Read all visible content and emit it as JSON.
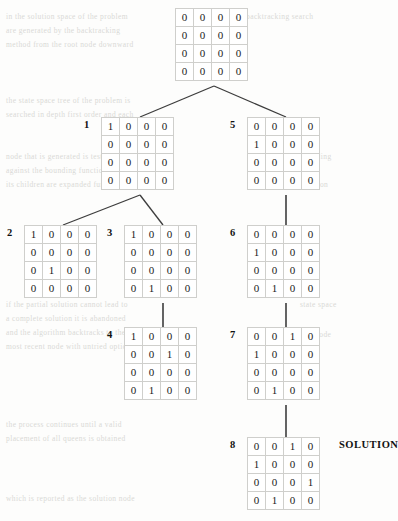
{
  "diagram": {
    "solution_label": "SOLUTION",
    "line_color": "#3d3d3d",
    "grid_border_color": "#b9b9b6",
    "cell_border_color": "#cfcfcc",
    "text_color": "#1a1a1a"
  },
  "nodes": [
    {
      "id": "root",
      "label": "",
      "x": 175,
      "y": 8,
      "rows": [
        [
          "0",
          "0",
          "0",
          "0"
        ],
        [
          "0",
          "0",
          "0",
          "0"
        ],
        [
          "0",
          "0",
          "0",
          "0"
        ],
        [
          "0",
          "0",
          "0",
          "0"
        ]
      ]
    },
    {
      "id": "n1",
      "label": "1",
      "x": 101,
      "y": 117,
      "rows": [
        [
          "1",
          "0",
          "0",
          "0"
        ],
        [
          "0",
          "0",
          "0",
          "0"
        ],
        [
          "0",
          "0",
          "0",
          "0"
        ],
        [
          "0",
          "0",
          "0",
          "0"
        ]
      ]
    },
    {
      "id": "n5",
      "label": "5",
      "x": 247,
      "y": 117,
      "rows": [
        [
          "0",
          "0",
          "0",
          "0"
        ],
        [
          "1",
          "0",
          "0",
          "0"
        ],
        [
          "0",
          "0",
          "0",
          "0"
        ],
        [
          "0",
          "0",
          "0",
          "0"
        ]
      ]
    },
    {
      "id": "n2",
      "label": "2",
      "x": 24,
      "y": 225,
      "rows": [
        [
          "1",
          "0",
          "0",
          "0"
        ],
        [
          "0",
          "0",
          "0",
          "0"
        ],
        [
          "0",
          "1",
          "0",
          "0"
        ],
        [
          "0",
          "0",
          "0",
          "0"
        ]
      ]
    },
    {
      "id": "n3",
      "label": "3",
      "x": 124,
      "y": 225,
      "rows": [
        [
          "1",
          "0",
          "0",
          "0"
        ],
        [
          "0",
          "0",
          "0",
          "0"
        ],
        [
          "0",
          "0",
          "0",
          "0"
        ],
        [
          "0",
          "1",
          "0",
          "0"
        ]
      ]
    },
    {
      "id": "n6",
      "label": "6",
      "x": 247,
      "y": 225,
      "rows": [
        [
          "0",
          "0",
          "0",
          "0"
        ],
        [
          "1",
          "0",
          "0",
          "0"
        ],
        [
          "0",
          "0",
          "0",
          "0"
        ],
        [
          "0",
          "1",
          "0",
          "0"
        ]
      ]
    },
    {
      "id": "n4",
      "label": "4",
      "x": 124,
      "y": 327,
      "rows": [
        [
          "1",
          "0",
          "0",
          "0"
        ],
        [
          "0",
          "0",
          "1",
          "0"
        ],
        [
          "0",
          "0",
          "0",
          "0"
        ],
        [
          "0",
          "1",
          "0",
          "0"
        ]
      ]
    },
    {
      "id": "n7",
      "label": "7",
      "x": 247,
      "y": 327,
      "rows": [
        [
          "0",
          "0",
          "1",
          "0"
        ],
        [
          "1",
          "0",
          "0",
          "0"
        ],
        [
          "0",
          "0",
          "0",
          "0"
        ],
        [
          "0",
          "1",
          "0",
          "0"
        ]
      ]
    },
    {
      "id": "n8",
      "label": "8",
      "x": 247,
      "y": 437,
      "rows": [
        [
          "0",
          "0",
          "1",
          "0"
        ],
        [
          "1",
          "0",
          "0",
          "0"
        ],
        [
          "0",
          "0",
          "0",
          "1"
        ],
        [
          "0",
          "1",
          "0",
          "0"
        ]
      ]
    }
  ],
  "edges": [
    {
      "from": "root",
      "to": "n1",
      "type": "diagonal"
    },
    {
      "from": "root",
      "to": "n5",
      "type": "diagonal"
    },
    {
      "from": "n1",
      "to": "n2",
      "type": "diagonal"
    },
    {
      "from": "n1",
      "to": "n3",
      "type": "diagonal"
    },
    {
      "from": "n3",
      "to": "n4",
      "type": "vertical"
    },
    {
      "from": "n5",
      "to": "n6",
      "type": "vertical"
    },
    {
      "from": "n6",
      "to": "n7",
      "type": "vertical"
    },
    {
      "from": "n7",
      "to": "n8",
      "type": "vertical"
    }
  ],
  "bleed_lines": [
    {
      "x": 6,
      "y": 12,
      "text": "in the solution space of the problem"
    },
    {
      "x": 6,
      "y": 26,
      "text": "are generated by the backtracking"
    },
    {
      "x": 6,
      "y": 40,
      "text": "method from the root node downward"
    },
    {
      "x": 6,
      "y": 96,
      "text": "the state space tree of the problem is"
    },
    {
      "x": 6,
      "y": 110,
      "text": "searched in depth first order and each"
    },
    {
      "x": 6,
      "y": 152,
      "text": "node that is generated is tested"
    },
    {
      "x": 6,
      "y": 166,
      "text": "against the bounding function before"
    },
    {
      "x": 6,
      "y": 180,
      "text": "its children are expanded further"
    },
    {
      "x": 6,
      "y": 300,
      "text": "if the partial solution cannot lead to"
    },
    {
      "x": 6,
      "y": 314,
      "text": "a complete solution it is abandoned"
    },
    {
      "x": 6,
      "y": 328,
      "text": "and the algorithm backtracks to the"
    },
    {
      "x": 6,
      "y": 342,
      "text": "most recent node with untried options"
    },
    {
      "x": 6,
      "y": 420,
      "text": "the process continues until a valid"
    },
    {
      "x": 6,
      "y": 434,
      "text": "placement of all queens is obtained"
    },
    {
      "x": 6,
      "y": 494,
      "text": "which is reported as the solution node"
    },
    {
      "x": 246,
      "y": 12,
      "text": "backtracking search"
    },
    {
      "x": 300,
      "y": 152,
      "text": "bounding"
    },
    {
      "x": 300,
      "y": 180,
      "text": "function"
    },
    {
      "x": 300,
      "y": 300,
      "text": "state space"
    },
    {
      "x": 300,
      "y": 330,
      "text": "tree node"
    }
  ]
}
